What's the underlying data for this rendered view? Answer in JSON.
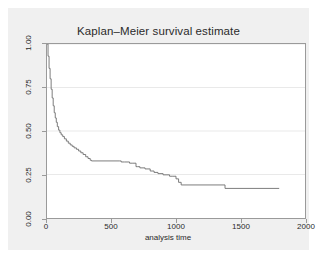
{
  "chart_data": {
    "type": "line",
    "subtype": "kaplan-meier-step",
    "title": "Kaplan–Meier survival estimate",
    "xlabel": "analysis time",
    "ylabel": "",
    "xlim": [
      0,
      2000
    ],
    "ylim": [
      0,
      1.0
    ],
    "xticks": [
      0,
      500,
      1000,
      1500,
      2000
    ],
    "xtick_labels": [
      "0",
      "500",
      "1000",
      "1500",
      "2000"
    ],
    "yticks": [
      0.0,
      0.25,
      0.5,
      0.75,
      1.0
    ],
    "ytick_labels": [
      "0.00",
      "0.25",
      "0.50",
      "0.75",
      "1.00"
    ],
    "grid": "horizontal",
    "legend": "none",
    "series": [
      {
        "name": "survival",
        "color": "#6e6e6e",
        "step": "post",
        "x": [
          0,
          8,
          16,
          24,
          32,
          40,
          48,
          56,
          64,
          72,
          80,
          90,
          100,
          110,
          122,
          135,
          150,
          165,
          180,
          195,
          210,
          228,
          245,
          262,
          280,
          300,
          318,
          335,
          345,
          560,
          575,
          600,
          640,
          660,
          690,
          700,
          720,
          760,
          800,
          830,
          860,
          900,
          930,
          950,
          970,
          1000,
          1020,
          1040,
          1380,
          1800
        ],
        "y": [
          1.0,
          0.93,
          0.86,
          0.8,
          0.74,
          0.69,
          0.645,
          0.605,
          0.575,
          0.55,
          0.525,
          0.505,
          0.49,
          0.478,
          0.468,
          0.455,
          0.442,
          0.43,
          0.42,
          0.412,
          0.403,
          0.395,
          0.385,
          0.375,
          0.365,
          0.352,
          0.342,
          0.332,
          0.328,
          0.328,
          0.322,
          0.322,
          0.315,
          0.315,
          0.295,
          0.295,
          0.288,
          0.282,
          0.27,
          0.262,
          0.255,
          0.248,
          0.248,
          0.24,
          0.24,
          0.225,
          0.205,
          0.19,
          0.17,
          0.17
        ]
      }
    ]
  },
  "axis": {
    "x_label_text": "analysis time"
  }
}
